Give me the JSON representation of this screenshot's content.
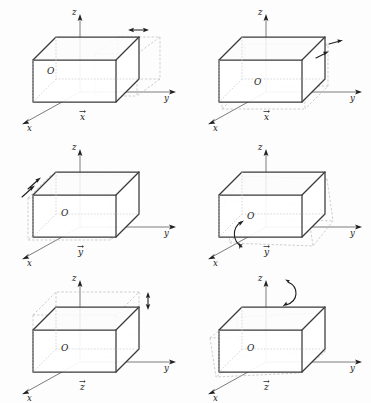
{
  "figure": {
    "title": "",
    "axis_labels": {
      "x": "x",
      "y": "y",
      "z": "z",
      "origin": "O"
    },
    "panels": [
      {
        "id": "panel-1",
        "position": "top-left",
        "caption": "x",
        "caption_accent": "vector-arrow",
        "transform": "translation-along-x",
        "marker": "double-arrow-horizontal",
        "marker_location": "top-right-corner"
      },
      {
        "id": "panel-2",
        "position": "top-right",
        "caption": "x",
        "caption_accent": "vector-arrow",
        "transform": "rotation-about-x",
        "marker": "pair-of-arrows-right",
        "marker_location": "right-face"
      },
      {
        "id": "panel-3",
        "position": "middle-left",
        "caption": "y",
        "caption_accent": "vector-arrow",
        "transform": "translation-along-y",
        "marker": "pair-of-arrows-upright",
        "marker_location": "upper-left-edge"
      },
      {
        "id": "panel-4",
        "position": "middle-right",
        "caption": "y",
        "caption_accent": "vector-arrow",
        "transform": "rotation-about-y",
        "marker": "curved-double-arrow",
        "marker_location": "bottom-front-edge"
      },
      {
        "id": "panel-5",
        "position": "bottom-left",
        "caption": "z",
        "caption_accent": "vector-arrow",
        "transform": "translation-along-z",
        "marker": "double-arrow-vertical",
        "marker_location": "top-right-corner"
      },
      {
        "id": "panel-6",
        "position": "bottom-right",
        "caption": "z",
        "caption_accent": "vector-arrow",
        "transform": "rotation-about-z",
        "marker": "curved-double-arrow",
        "marker_location": "top-face"
      }
    ],
    "colors": {
      "ink": "#1f1f1f",
      "solid_edge": "#3a3a3a",
      "inner_edge": "#7a7a7a",
      "ghost_edge": "#b9b9b9",
      "axis": "#6e6e6e",
      "background": "#fdfdfd"
    }
  }
}
